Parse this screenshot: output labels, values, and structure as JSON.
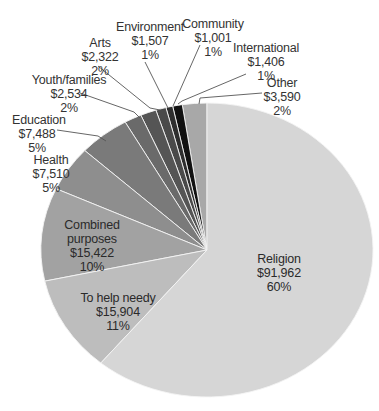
{
  "chart_data": {
    "type": "pie",
    "title": "",
    "unit": "$",
    "start_angle_deg": 0,
    "direction": "counterclockwise-from-top",
    "slices": [
      {
        "key": "other",
        "label": "Other",
        "value": 3590,
        "display_value": "$3,590",
        "percent": "2%",
        "color": "#a8a8a8"
      },
      {
        "key": "international",
        "label": "International",
        "value": 1406,
        "display_value": "$1,406",
        "percent": "1%",
        "color": "#111111"
      },
      {
        "key": "community",
        "label": "Community",
        "value": 1001,
        "display_value": "$1,001",
        "percent": "1%",
        "color": "#2e2e2e"
      },
      {
        "key": "environment",
        "label": "Environment",
        "value": 1507,
        "display_value": "$1,507",
        "percent": "1%",
        "color": "#4a4a4a"
      },
      {
        "key": "arts",
        "label": "Arts",
        "value": 2322,
        "display_value": "$2,322",
        "percent": "2%",
        "color": "#555555"
      },
      {
        "key": "youth_families",
        "label": "Youth/families",
        "value": 2534,
        "display_value": "$2,534",
        "percent": "2%",
        "color": "#6a6a6a"
      },
      {
        "key": "education",
        "label": "Education",
        "value": 7488,
        "display_value": "$7,488",
        "percent": "5%",
        "color": "#7a7a7a"
      },
      {
        "key": "health",
        "label": "Health",
        "value": 7510,
        "display_value": "$7,510",
        "percent": "5%",
        "color": "#8e8e8e"
      },
      {
        "key": "combined_purposes",
        "label": "Combined purposes",
        "value": 15422,
        "display_value": "$15,422",
        "percent": "10%",
        "color": "#a2a2a2"
      },
      {
        "key": "to_help_needy",
        "label": "To help needy",
        "value": 15904,
        "display_value": "$15,904",
        "percent": "11%",
        "color": "#bdbdbd"
      },
      {
        "key": "religion",
        "label": "Religion",
        "value": 91962,
        "display_value": "$91,962",
        "percent": "60%",
        "color": "#d6d6d6"
      }
    ]
  },
  "labels": {
    "other": {
      "name": "Other",
      "value": "$3,590",
      "pct": "2%"
    },
    "international": {
      "name": "International",
      "value": "$1,406",
      "pct": "1%"
    },
    "community": {
      "name": "Community",
      "value": "$1,001",
      "pct": "1%"
    },
    "environment": {
      "name": "Environment",
      "value": "$1,507",
      "pct": "1%"
    },
    "arts": {
      "name": "Arts",
      "value": "$2,322",
      "pct": "2%"
    },
    "youth_families": {
      "name": "Youth/families",
      "value": "$2,534",
      "pct": "2%"
    },
    "education": {
      "name": "Education",
      "value": "$7,488",
      "pct": "5%"
    },
    "health": {
      "name": "Health",
      "value": "$7,510",
      "pct": "5%"
    },
    "combined_purposes": {
      "name1": "Combined",
      "name2": "purposes",
      "value": "$15,422",
      "pct": "10%"
    },
    "to_help_needy": {
      "name": "To help needy",
      "value": "$15,904",
      "pct": "11%"
    },
    "religion": {
      "name": "Religion",
      "value": "$91,962",
      "pct": "60%"
    }
  }
}
